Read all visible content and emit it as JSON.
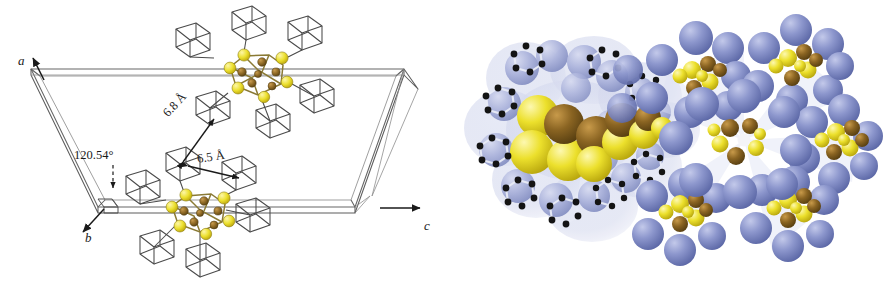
{
  "figure": {
    "background_color": "#ffffff",
    "width": 888,
    "height": 292
  },
  "panels": [
    {
      "id": "left",
      "name": "unit-cell-wireframe-panel",
      "description": "Wireframe monoclinic unit cell containing two ball-and-stick metal-sulfur cluster cores surrounded by adamantyl cage ligands, with interatomic distance annotations."
    },
    {
      "id": "right",
      "name": "space-filling-packing-panel",
      "description": "Space-filling (van der Waals) representation of the cluster packing: a tilted cluster at left with ball-and-stick overlay, and a central cluster surrounded by six neighbouring clusters in a rosette arrangement."
    }
  ],
  "axes": {
    "a": {
      "label": "a",
      "direction": "up-right"
    },
    "b": {
      "label": "b",
      "direction": "down-left"
    },
    "c": {
      "label": "c",
      "direction": "right"
    }
  },
  "annotations": {
    "angle": {
      "label": "120.54°",
      "name": "beta-angle-label"
    },
    "distances": [
      {
        "label": "6.8 Å",
        "name": "distance-6-8-label"
      },
      {
        "label": "6.5 Å",
        "name": "distance-6-5-label"
      }
    ]
  },
  "colors": {
    "sulfur_yellow": "#e8d32a",
    "sulfur_yellow_light": "#f2e85c",
    "copper_brown": "#8a6422",
    "copper_brown_light": "#a87c32",
    "ligand_blue": "#7b86c4",
    "ligand_blue_light": "#9aa3d4",
    "vdw_halo": "#c3c8e6",
    "wireframe_gray": "#4a4a4a",
    "cell_edge_gray": "#6a6a6a",
    "carbon_black": "#141414",
    "background": "#ffffff"
  }
}
